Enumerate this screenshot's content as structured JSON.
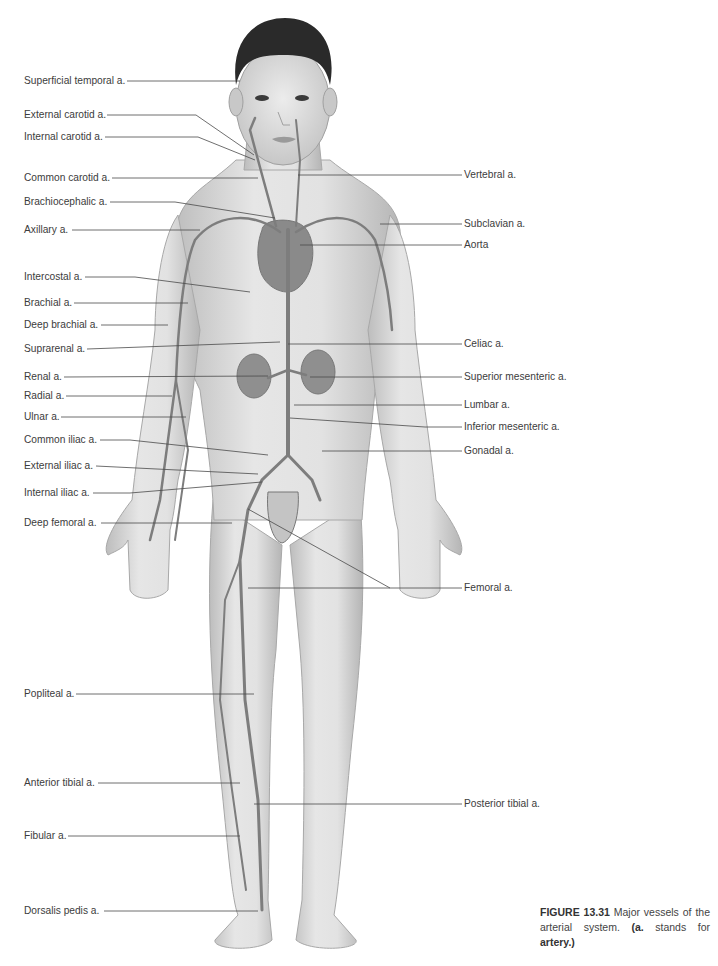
{
  "figure": {
    "caption": {
      "number": "FIGURE 13.31",
      "text_1": " Major vessels of the arterial system. ",
      "abbr": "(a.",
      "text_2": " stands for ",
      "term": "artery.)"
    },
    "colors": {
      "skin_light": "#e4e4e4",
      "skin_mid": "#c9c9c9",
      "skin_dark": "#9a9a9a",
      "hair": "#2a2a2a",
      "artery": "#7d7d7d",
      "leader_line": "#4a4a4a",
      "label_text": "#3c3c3c"
    },
    "left_labels": [
      {
        "text": "Superficial temporal a.",
        "y": 81
      },
      {
        "text": "External carotid a.",
        "y": 115
      },
      {
        "text": "Internal carotid a.",
        "y": 137
      },
      {
        "text": "Common carotid a.",
        "y": 178
      },
      {
        "text": "Brachiocephalic a.",
        "y": 202
      },
      {
        "text": "Axillary a.",
        "y": 230
      },
      {
        "text": "Intercostal a.",
        "y": 277
      },
      {
        "text": "Brachial a.",
        "y": 303
      },
      {
        "text": "Deep brachial a.",
        "y": 325
      },
      {
        "text": "Suprarenal a.",
        "y": 349
      },
      {
        "text": "Renal a.",
        "y": 377
      },
      {
        "text": "Radial a.",
        "y": 396
      },
      {
        "text": "Ulnar a.",
        "y": 417
      },
      {
        "text": "Common iliac a.",
        "y": 440
      },
      {
        "text": "External iliac a.",
        "y": 466
      },
      {
        "text": "Internal iliac a.",
        "y": 493
      },
      {
        "text": "Deep femoral a.",
        "y": 523
      },
      {
        "text": "Popliteal a.",
        "y": 694
      },
      {
        "text": "Anterior tibial a.",
        "y": 783
      },
      {
        "text": "Fibular a.",
        "y": 836
      },
      {
        "text": "Dorsalis pedis a.",
        "y": 911
      }
    ],
    "right_labels": [
      {
        "text": "Vertebral a.",
        "y": 175
      },
      {
        "text": "Subclavian a.",
        "y": 224
      },
      {
        "text": "Aorta",
        "y": 245
      },
      {
        "text": "Celiac a.",
        "y": 344
      },
      {
        "text": "Superior mesenteric a.",
        "y": 377
      },
      {
        "text": "Lumbar a.",
        "y": 405
      },
      {
        "text": "Inferior mesenteric a.",
        "y": 427
      },
      {
        "text": "Gonadal a.",
        "y": 451
      },
      {
        "text": "Femoral a.",
        "y": 588
      },
      {
        "text": "Posterior tibial a.",
        "y": 804
      }
    ]
  }
}
